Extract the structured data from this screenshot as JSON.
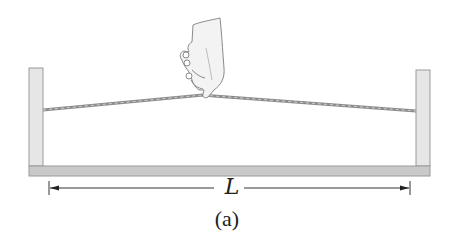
{
  "figure": {
    "dimension_label": "L",
    "caption": "(a)",
    "colors": {
      "post_fill": "#e6e6e6",
      "post_stroke": "#9a9a9a",
      "base_fill": "#c9c9c9",
      "string": "#8c8c8c",
      "text": "#222222"
    },
    "elements": [
      "left-post",
      "right-post",
      "base-board",
      "string",
      "hand",
      "dimension-arrow"
    ]
  }
}
